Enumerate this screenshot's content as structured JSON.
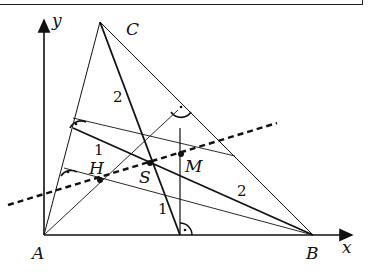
{
  "diagram": {
    "axes": {
      "x_label": "x",
      "y_label": "y"
    },
    "points": {
      "A": {
        "label": "A",
        "x": 44,
        "y": 235
      },
      "B": {
        "label": "B",
        "x": 313,
        "y": 235
      },
      "C": {
        "label": "C",
        "x": 100,
        "y": 22
      },
      "H": {
        "label": "H",
        "x": 100,
        "y": 180
      },
      "S": {
        "label": "S",
        "x": 150,
        "y": 163
      },
      "M": {
        "label": "M",
        "x": 181,
        "y": 154
      }
    },
    "ratio_labels": {
      "median_c_upper": "2",
      "median_c_lower": "1",
      "median_a_left": "1",
      "median_a_right": "2"
    },
    "right_angle_marker": "·",
    "colors": {
      "stroke": "#111111",
      "background": "#ffffff"
    }
  }
}
